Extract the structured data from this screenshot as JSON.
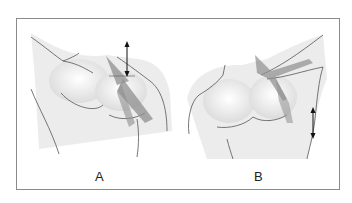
{
  "figure": {
    "panels": [
      {
        "id": "A",
        "label": "A",
        "description": "Anterior chest and shoulder, right side, with muscle fibers shaded and vertical double-headed arrow above shoulder"
      },
      {
        "id": "B",
        "label": "B",
        "description": "Anterior chest and shoulder with raised arm, muscle fibers shaded and vertical double-headed arrow beside axilla"
      }
    ],
    "colors": {
      "outline": "#555555",
      "muscle": "#8f8f8f",
      "skin_shade": "#e6e6e6",
      "frame": "#8a8a8a",
      "arrow": "#111111"
    }
  }
}
